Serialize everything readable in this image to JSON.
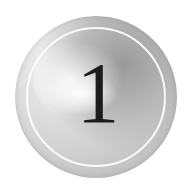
{
  "badge": {
    "numeral": "1",
    "colors": {
      "numeral": "#1c1c1c",
      "ring": "#ffffff",
      "base": "#c4c4c4",
      "highlight": "#f2f2f2"
    }
  }
}
